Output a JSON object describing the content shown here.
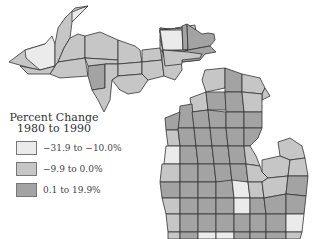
{
  "map": {
    "region": "Michigan counties",
    "legend": {
      "title_line1": "Percent Change",
      "title_line2": "1980 to 1990",
      "classes": [
        {
          "label": "−31.9 to −10.0%",
          "color": "#ebebeb"
        },
        {
          "label": "−9.9 to 0.0%",
          "color": "#c6c6c6"
        },
        {
          "label": "0.1 to 19.9%",
          "color": "#a3a3a3"
        }
      ]
    },
    "colors": {
      "border": "#333333",
      "background": "#ffffff"
    }
  }
}
